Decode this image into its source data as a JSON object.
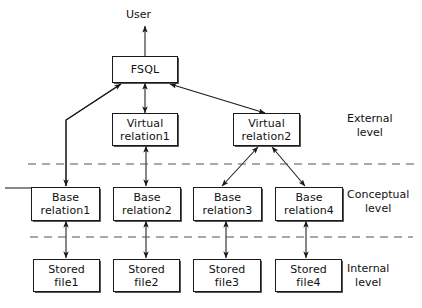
{
  "diagram": {
    "title": "User",
    "top_label": "User",
    "nodes": [
      {
        "id": "fsql",
        "line1": "FSQL",
        "line2": "",
        "x": 112,
        "y": 56,
        "w": 66,
        "h": 27
      },
      {
        "id": "vrel1",
        "line1": "Virtual",
        "line2": "relation1",
        "x": 112,
        "y": 113,
        "w": 66,
        "h": 33
      },
      {
        "id": "vrel2",
        "line1": "Virtual",
        "line2": "relation2",
        "x": 233,
        "y": 113,
        "w": 67,
        "h": 33
      },
      {
        "id": "brel1",
        "line1": "Base",
        "line2": "relation1",
        "x": 31,
        "y": 187,
        "w": 69,
        "h": 34
      },
      {
        "id": "brel2",
        "line1": "Base",
        "line2": "relation2",
        "x": 113,
        "y": 187,
        "w": 68,
        "h": 34
      },
      {
        "id": "brel3",
        "line1": "Base",
        "line2": "relation3",
        "x": 193,
        "y": 187,
        "w": 69,
        "h": 34
      },
      {
        "id": "brel4",
        "line1": "Base",
        "line2": "relation4",
        "x": 275,
        "y": 187,
        "w": 68,
        "h": 34
      },
      {
        "id": "sfile1",
        "line1": "Stored",
        "line2": "file1",
        "x": 33,
        "y": 259,
        "w": 67,
        "h": 33
      },
      {
        "id": "sfile2",
        "line1": "Stored",
        "line2": "file2",
        "x": 113,
        "y": 259,
        "w": 67,
        "h": 33
      },
      {
        "id": "sfile3",
        "line1": "Stored",
        "line2": "file3",
        "x": 193,
        "y": 259,
        "w": 68,
        "h": 33
      },
      {
        "id": "sfile4",
        "line1": "Stored",
        "line2": "file4",
        "x": 275,
        "y": 259,
        "w": 67,
        "h": 33
      }
    ],
    "levels": [
      {
        "id": "external",
        "line1": "External",
        "line2": "level",
        "x": 347,
        "y": 112
      },
      {
        "id": "conceptual",
        "line1": "Conceptual",
        "line2": "level",
        "x": 347,
        "y": 188
      },
      {
        "id": "internal",
        "line1": "Internal",
        "line2": "level",
        "x": 347,
        "y": 262
      }
    ],
    "dividers": [
      {
        "id": "external-conceptual-divider",
        "y": 164,
        "x1": 28,
        "x2": 416
      },
      {
        "id": "conceptual-internal-divider",
        "y": 237,
        "x1": 30,
        "x2": 413
      }
    ],
    "colors": {
      "stroke": "#1a1a1a",
      "divider": "#555555",
      "background": "#ffffff",
      "text": "#111111"
    },
    "edges": [
      {
        "id": "fsql-to-user",
        "from": "fsql",
        "to": "user",
        "kind": "single-up"
      },
      {
        "id": "fsql-to-brel1",
        "from": "fsql",
        "to": "brel1",
        "kind": "double-bent"
      },
      {
        "id": "fsql-to-vrel1",
        "from": "fsql",
        "to": "vrel1",
        "kind": "double"
      },
      {
        "id": "fsql-to-vrel2",
        "from": "fsql",
        "to": "vrel2",
        "kind": "double-diagonal"
      },
      {
        "id": "vrel1-to-brel2",
        "from": "vrel1",
        "to": "brel2",
        "kind": "double"
      },
      {
        "id": "vrel2-to-brel3",
        "from": "vrel2",
        "to": "brel3",
        "kind": "double-diagonal"
      },
      {
        "id": "vrel2-to-brel4",
        "from": "vrel2",
        "to": "brel4",
        "kind": "double-diagonal"
      },
      {
        "id": "brel1-to-sfile1",
        "from": "brel1",
        "to": "sfile1",
        "kind": "double"
      },
      {
        "id": "brel2-to-sfile2",
        "from": "brel2",
        "to": "sfile2",
        "kind": "double"
      },
      {
        "id": "brel3-to-sfile3",
        "from": "brel3",
        "to": "sfile3",
        "kind": "double"
      },
      {
        "id": "brel4-to-sfile4",
        "from": "brel4",
        "to": "sfile4",
        "kind": "double"
      }
    ]
  }
}
